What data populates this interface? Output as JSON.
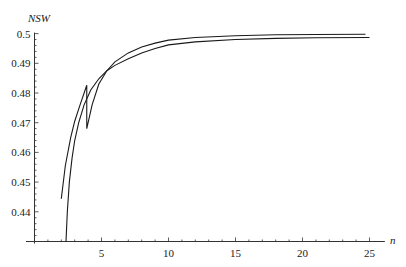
{
  "chart_data": {
    "type": "line",
    "title": "",
    "xlabel": "n",
    "ylabel": "NSW",
    "xlim": [
      0,
      26
    ],
    "ylim": [
      0.43,
      0.5
    ],
    "x_origin": 0,
    "y_origin": 0.43,
    "grid": false,
    "legend": "none",
    "x_ticks": [
      5,
      10,
      15,
      20,
      25
    ],
    "x_tick_labels": [
      "5",
      "10",
      "15",
      "20",
      "25"
    ],
    "x_minor_step": 1,
    "y_ticks": [
      0.44,
      0.45,
      0.46,
      0.47,
      0.48,
      0.49,
      0.5
    ],
    "y_tick_labels": [
      "0.44",
      "0.45",
      "0.46",
      "0.47",
      "0.48",
      "0.49",
      "0.5"
    ],
    "y_minor_step": 0.002,
    "series": [
      {
        "name": "curve-a",
        "x": [
          2.0,
          2.3,
          2.7,
          3.0,
          3.4,
          3.9,
          3.9,
          4.3,
          4.8,
          5.4,
          6.0,
          7.0,
          8.0,
          9.0,
          10.0,
          12.0,
          15.0,
          18.0,
          21.0,
          24.7
        ],
        "y": [
          0.4444,
          0.4555,
          0.465,
          0.4705,
          0.476,
          0.4826,
          0.468,
          0.476,
          0.483,
          0.4875,
          0.4905,
          0.4935,
          0.4955,
          0.4968,
          0.4978,
          0.4987,
          0.4993,
          0.4996,
          0.4997,
          0.4998
        ]
      },
      {
        "name": "curve-b",
        "x": [
          2.35,
          2.45,
          2.6,
          2.8,
          3.0,
          3.3,
          3.7,
          4.2,
          4.8,
          5.4,
          6.0,
          7.0,
          8.0,
          9.0,
          10.0,
          12.0,
          15.0,
          18.0,
          21.0,
          25.0
        ],
        "y": [
          0.43,
          0.44,
          0.45,
          0.458,
          0.464,
          0.47,
          0.476,
          0.481,
          0.4848,
          0.4875,
          0.4893,
          0.4915,
          0.4935,
          0.495,
          0.4962,
          0.4972,
          0.498,
          0.4984,
          0.4986,
          0.4987
        ]
      }
    ]
  }
}
